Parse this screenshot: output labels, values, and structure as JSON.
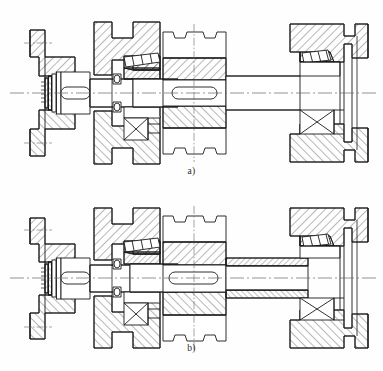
{
  "document": {
    "kind": "engineering-drawing",
    "title": "Shaft assembly sectional views",
    "sheet_color": "#fefefe",
    "line_color": "#1a1a1a",
    "hatch_color": "#333333",
    "centerline_color": "#555555"
  },
  "figures": [
    {
      "id": "a",
      "caption": "a)",
      "description": "Sectional view of shaft assembly with solid output shaft journal between gear and right bearing",
      "components": [
        {
          "name": "end-flange",
          "position": "left"
        },
        {
          "name": "lock-nut-washer",
          "position": "left-shaft-end"
        },
        {
          "name": "keyway-left",
          "position": "left-journal"
        },
        {
          "name": "left-housing",
          "position": "left"
        },
        {
          "name": "left-tapered-roller-bearing",
          "position": "left"
        },
        {
          "name": "seal-ring-left",
          "position": "left"
        },
        {
          "name": "center-gear",
          "position": "middle"
        },
        {
          "name": "keyway-center",
          "position": "middle"
        },
        {
          "name": "right-journal-solid",
          "position": "right"
        },
        {
          "name": "right-tapered-roller-bearing",
          "position": "right"
        },
        {
          "name": "right-housing-cover",
          "position": "right"
        },
        {
          "name": "axis-centerline",
          "position": "horizontal"
        }
      ]
    },
    {
      "id": "b",
      "caption": "b)",
      "description": "Sectional view of shaft assembly with sectioned (hatched) hollow sleeve journal between gear and right bearing",
      "components": [
        {
          "name": "end-flange",
          "position": "left"
        },
        {
          "name": "lock-nut-washer",
          "position": "left-shaft-end"
        },
        {
          "name": "keyway-left",
          "position": "left-journal"
        },
        {
          "name": "left-housing",
          "position": "left"
        },
        {
          "name": "left-tapered-roller-bearing",
          "position": "left"
        },
        {
          "name": "seal-ring-left",
          "position": "left"
        },
        {
          "name": "center-gear",
          "position": "middle"
        },
        {
          "name": "keyway-center",
          "position": "middle"
        },
        {
          "name": "right-journal-sectioned",
          "position": "right"
        },
        {
          "name": "right-tapered-roller-bearing",
          "position": "right"
        },
        {
          "name": "right-housing-cover",
          "position": "right"
        },
        {
          "name": "axis-centerline",
          "position": "horizontal"
        }
      ]
    }
  ]
}
